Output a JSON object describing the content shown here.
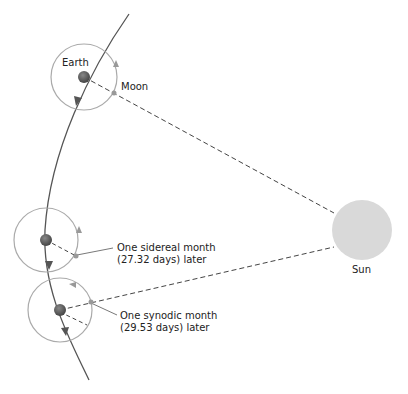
{
  "diagram": {
    "labels": {
      "earth": "Earth",
      "moon": "Moon",
      "sun": "Sun",
      "sidereal_line1": "One sidereal month",
      "sidereal_line2": "(27.32 days) later",
      "synodic_line1": "One synodic month",
      "synodic_line2": "(29.53 days) later"
    },
    "colors": {
      "orbit_path": "#555555",
      "moon_orbit": "#aaaaaa",
      "earth": "#555555",
      "sun": "#d9d9d9",
      "dash": "#444444"
    }
  }
}
